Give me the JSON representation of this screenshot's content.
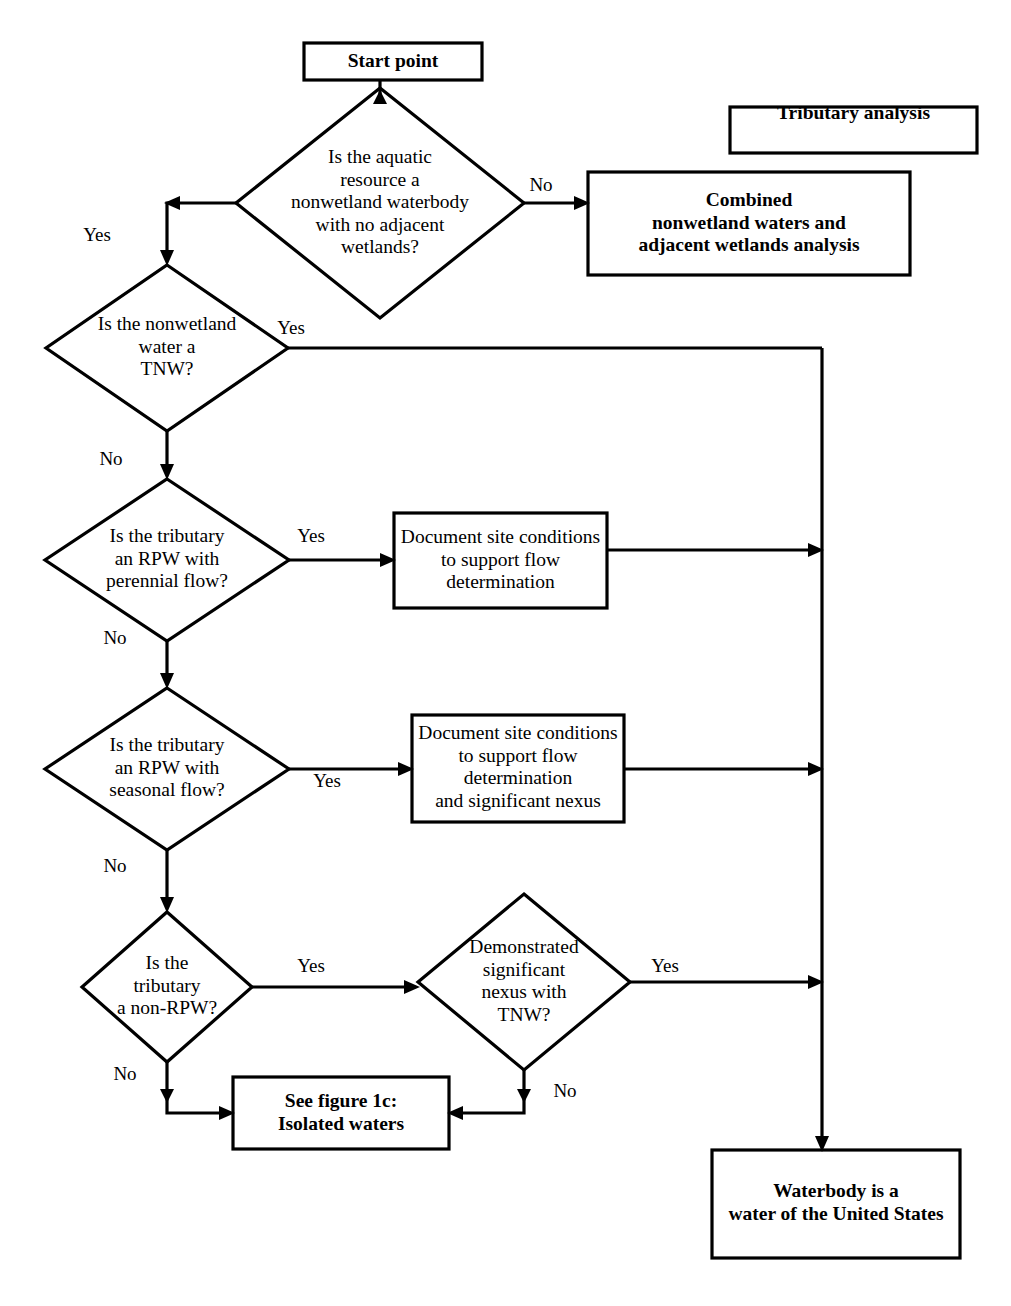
{
  "diagram": {
    "title_shape": "flowchart",
    "nodes": {
      "start": {
        "label": "Start point",
        "shape": "box",
        "bold": true
      },
      "tributary_analysis": {
        "label": "Tributary analysis",
        "shape": "box",
        "bold": true
      },
      "q_aquatic_resource": {
        "label": "Is the aquatic\nresource a\nnonwetland waterbody\nwith no adjacent\nwetlands?",
        "shape": "diamond",
        "bold": false
      },
      "combined_analysis": {
        "label": "Combined\nnonwetland waters and\nadjacent wetlands analysis",
        "shape": "box",
        "bold": true
      },
      "q_tnw": {
        "label": "Is the nonwetland\nwater a\nTNW?",
        "shape": "diamond",
        "bold": false
      },
      "q_rpw_perennial": {
        "label": "Is the tributary\nan RPW with\nperennial flow?",
        "shape": "diamond",
        "bold": false
      },
      "doc_perennial": {
        "label": "Document site conditions\nto support flow\ndetermination",
        "shape": "box",
        "bold": false
      },
      "q_rpw_seasonal": {
        "label": "Is the tributary\nan RPW with\nseasonal flow?",
        "shape": "diamond",
        "bold": false
      },
      "doc_seasonal": {
        "label": "Document site conditions\nto support flow\ndetermination\nand significant nexus",
        "shape": "box",
        "bold": false
      },
      "q_non_rpw": {
        "label": "Is the\ntributary\na non-RPW?",
        "shape": "diamond",
        "bold": false
      },
      "q_significant_nexus": {
        "label": "Demonstrated\nsignificant\nnexus with\nTNW?",
        "shape": "diamond",
        "bold": false
      },
      "isolated_waters": {
        "label": "See figure 1c:\nIsolated waters",
        "shape": "box",
        "bold": true
      },
      "waterbody_result": {
        "label": "Waterbody is a\nwater of the United States",
        "shape": "box",
        "bold": true
      }
    },
    "edge_labels": [
      {
        "id": "aquatic-no",
        "text": "No"
      },
      {
        "id": "aquatic-yes",
        "text": "Yes"
      },
      {
        "id": "tnw-yes",
        "text": "Yes"
      },
      {
        "id": "tnw-no",
        "text": "No"
      },
      {
        "id": "perennial-yes",
        "text": "Yes"
      },
      {
        "id": "perennial-no",
        "text": "No"
      },
      {
        "id": "seasonal-yes",
        "text": "Yes"
      },
      {
        "id": "seasonal-no",
        "text": "No"
      },
      {
        "id": "nonrpw-yes",
        "text": "Yes"
      },
      {
        "id": "nonrpw-no",
        "text": "No"
      },
      {
        "id": "nexus-yes",
        "text": "Yes"
      },
      {
        "id": "nexus-no",
        "text": "No"
      }
    ],
    "colors": {
      "stroke": "#000000",
      "fill": "#ffffff",
      "text": "#000000"
    }
  }
}
